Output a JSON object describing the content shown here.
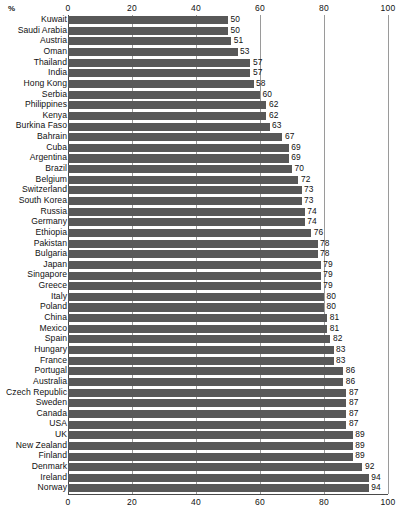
{
  "chart_data": {
    "type": "bar",
    "orientation": "horizontal",
    "title": "",
    "subtitle": "",
    "xlabel": "%",
    "ylabel": "",
    "unit_label": "%",
    "xlim": [
      0,
      100
    ],
    "xticks": [
      0,
      20,
      40,
      60,
      80,
      100
    ],
    "xtick_labels": [
      "0",
      "20",
      "40",
      "60",
      "80",
      "100"
    ],
    "grid": true,
    "grid_axis": "x",
    "legend": false,
    "legend_position": "none",
    "top_axis": true,
    "bottom_axis": true,
    "bar_color": "#585858",
    "show_value_labels": true,
    "categories": [
      "Kuwait",
      "Saudi Arabia",
      "Austria",
      "Oman",
      "Thailand",
      "India",
      "Hong Kong",
      "Serbia",
      "Philippines",
      "Kenya",
      "Burkina Faso",
      "Bahrain",
      "Cuba",
      "Argentina",
      "Brazil",
      "Belgium",
      "Switzerland",
      "South Korea",
      "Russia",
      "Germany",
      "Ethiopia",
      "Pakistan",
      "Bulgaria",
      "Japan",
      "Singapore",
      "Greece",
      "Italy",
      "Poland",
      "China",
      "Mexico",
      "Spain",
      "Hungary",
      "France",
      "Portugal",
      "Australia",
      "Czech Republic",
      "Sweden",
      "Canada",
      "USA",
      "UK",
      "New Zealand",
      "Finland",
      "Denmark",
      "Ireland",
      "Norway"
    ],
    "values": [
      50,
      50,
      51,
      53,
      57,
      57,
      58,
      60,
      62,
      62,
      63,
      67,
      69,
      69,
      70,
      72,
      73,
      73,
      74,
      74,
      76,
      78,
      78,
      79,
      79,
      79,
      80,
      80,
      81,
      81,
      82,
      83,
      83,
      86,
      86,
      87,
      87,
      87,
      87,
      89,
      89,
      89,
      92,
      94,
      94
    ]
  }
}
